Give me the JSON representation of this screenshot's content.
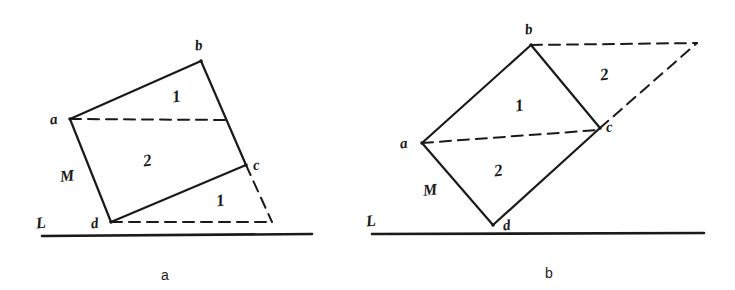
{
  "figure": {
    "type": "geometry-diagram",
    "panels": [
      {
        "id": "a",
        "caption": "a",
        "caption_pos": [
          161,
          268
        ],
        "baseline": {
          "label": "L",
          "label_pos": [
            36,
            215
          ],
          "x1": 42,
          "y1": 236,
          "x2": 312,
          "y2": 234
        },
        "side_label": {
          "label": "M",
          "pos": [
            60,
            168
          ]
        },
        "vertices": [
          {
            "name": "a",
            "x": 70,
            "y": 119,
            "label_pos": [
              50,
              112
            ]
          },
          {
            "name": "b",
            "x": 201,
            "y": 61,
            "label_pos": [
              195,
              38
            ]
          },
          {
            "name": "c",
            "x": 246,
            "y": 165,
            "label_pos": [
              253,
              158
            ]
          },
          {
            "name": "d",
            "x": 111,
            "y": 222,
            "label_pos": [
              91,
              216
            ]
          }
        ],
        "solid_edges": [
          [
            "a",
            "b"
          ],
          [
            "b",
            "c"
          ],
          [
            "c",
            "d"
          ],
          [
            "d",
            "a"
          ]
        ],
        "dashed_segments": [
          {
            "from": [
              70,
              119
            ],
            "to": [
              228,
              120
            ]
          },
          {
            "from": [
              111,
              222
            ],
            "to": [
              272,
              222
            ]
          },
          {
            "from": [
              246,
              165
            ],
            "to": [
              272,
              222
            ]
          }
        ],
        "region_labels": [
          {
            "text": "1",
            "x": 172,
            "y": 88
          },
          {
            "text": "2",
            "x": 143,
            "y": 152
          },
          {
            "text": "1",
            "x": 216,
            "y": 192
          }
        ]
      },
      {
        "id": "b",
        "caption": "b",
        "caption_pos": [
          545,
          266
        ],
        "baseline": {
          "label": "L",
          "label_pos": [
            366,
            213
          ],
          "x1": 372,
          "y1": 234,
          "x2": 704,
          "y2": 233
        },
        "side_label": {
          "label": "M",
          "pos": [
            423,
            182
          ]
        },
        "vertices": [
          {
            "name": "a",
            "x": 422,
            "y": 143,
            "label_pos": [
              400,
              136
            ]
          },
          {
            "name": "b",
            "x": 531,
            "y": 45,
            "label_pos": [
              525,
              22
            ]
          },
          {
            "name": "c",
            "x": 600,
            "y": 128,
            "label_pos": [
              606,
              120
            ]
          },
          {
            "name": "d",
            "x": 493,
            "y": 225,
            "label_pos": [
              503,
              218
            ]
          }
        ],
        "solid_edges": [
          [
            "a",
            "b"
          ],
          [
            "b",
            "c"
          ],
          [
            "c",
            "d"
          ],
          [
            "d",
            "a"
          ]
        ],
        "dashed_segments": [
          {
            "from": [
              422,
              143
            ],
            "to": [
              598,
              130
            ]
          },
          {
            "from": [
              531,
              45
            ],
            "to": [
              697,
              43
            ]
          },
          {
            "from": [
              600,
              128
            ],
            "to": [
              697,
              43
            ]
          }
        ],
        "region_labels": [
          {
            "text": "1",
            "x": 515,
            "y": 97
          },
          {
            "text": "2",
            "x": 600,
            "y": 66
          },
          {
            "text": "2",
            "x": 494,
            "y": 162
          }
        ]
      }
    ],
    "style": {
      "ink": "#1a1a1a",
      "background": "#ffffff",
      "solid_stroke_width": 2.2,
      "dashed_stroke_width": 2.0,
      "baseline_stroke_width": 2.6,
      "dash_pattern": "11 7"
    }
  }
}
